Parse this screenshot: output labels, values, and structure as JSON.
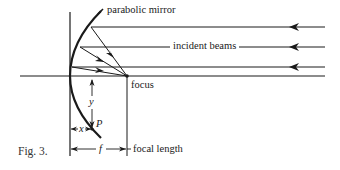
{
  "figure": {
    "caption": "Fig. 3.",
    "labels": {
      "mirror": "parabolic mirror",
      "beams": "incident beams",
      "focus": "focus",
      "focal_length": "focal length",
      "y_var": "y",
      "x_var": "x",
      "point": "P",
      "f_var": "f"
    },
    "elements": {
      "incident_beam_count": 3,
      "beam_direction": "right-to-left",
      "reflected_rays_to_focus": 3
    }
  }
}
